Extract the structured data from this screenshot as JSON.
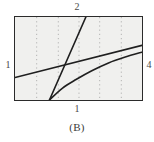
{
  "figure": {
    "caption": "(B)",
    "labels": {
      "top": "2",
      "bottom": "1",
      "left": "1",
      "right": "4"
    },
    "colors": {
      "frame": "#2b2b2b",
      "plot_background": "#f0f0ee",
      "gridline": "#9a9a9a",
      "curve": "#1f1f1f",
      "text": "#4a4a4a"
    }
  },
  "chart_data": {
    "type": "line",
    "title": "(B)",
    "xlabel": "1",
    "ylabel": "",
    "xlim": [
      0,
      129
    ],
    "ylim": [
      0,
      85
    ],
    "grid": true,
    "grid_orientation": "vertical",
    "grid_x": [
      22,
      44,
      65,
      86,
      108
    ],
    "legend": "none",
    "annotations": [
      {
        "text": "2",
        "position": "top",
        "x": 71,
        "y": 0
      },
      {
        "text": "1",
        "position": "left",
        "x": 0,
        "y": 46
      },
      {
        "text": "4",
        "position": "right",
        "x": 129,
        "y": 46
      },
      {
        "text": "1",
        "position": "bottom",
        "x": 71,
        "y": 85
      }
    ],
    "series": [
      {
        "name": "steep-line",
        "type": "line",
        "shape": "straight",
        "points": [
          [
            35,
            85
          ],
          [
            72,
            0
          ]
        ]
      },
      {
        "name": "gentle-line",
        "type": "line",
        "shape": "straight",
        "points": [
          [
            0,
            62
          ],
          [
            129,
            29
          ]
        ]
      },
      {
        "name": "rising-curve",
        "type": "line",
        "shape": "concave",
        "points": [
          [
            35,
            85
          ],
          [
            48,
            73
          ],
          [
            62,
            64
          ],
          [
            78,
            55
          ],
          [
            95,
            47
          ],
          [
            112,
            41
          ],
          [
            129,
            36
          ]
        ]
      }
    ]
  }
}
